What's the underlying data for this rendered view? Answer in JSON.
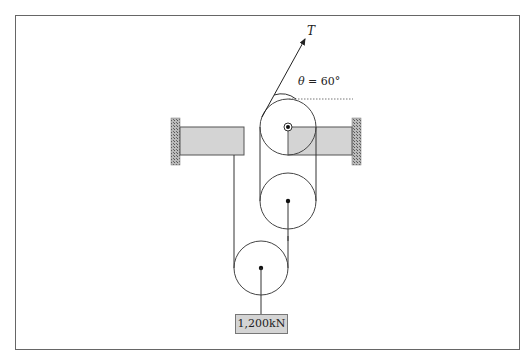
{
  "diagram": {
    "heading_clipped": "",
    "tension_label": "T",
    "angle_symbol": "θ",
    "angle_value": " = 60°",
    "weight_label": "1,200kN",
    "colors": {
      "line": "#333333",
      "beam_fill": "#d4d4d4",
      "wall_hatch": "#888888",
      "frame": "#666666"
    },
    "components": {
      "pulleys": [
        {
          "name": "top-fixed-pulley",
          "cx": 288,
          "cy": 127,
          "r": 28
        },
        {
          "name": "middle-pulley",
          "cx": 288,
          "cy": 201,
          "r": 28
        },
        {
          "name": "bottom-pulley",
          "cx": 261,
          "cy": 268,
          "r": 27
        }
      ],
      "walls": [
        "left-wall",
        "right-wall"
      ],
      "beams": [
        "left-beam",
        "right-beam"
      ]
    }
  }
}
